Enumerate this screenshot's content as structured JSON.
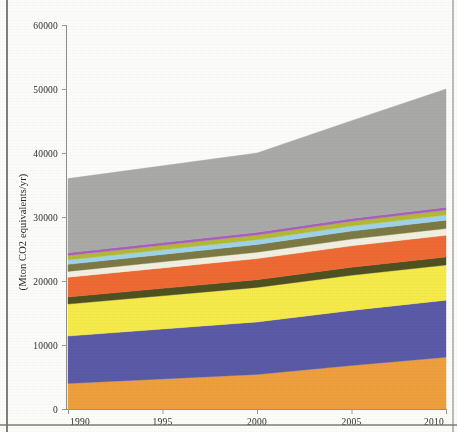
{
  "figure": {
    "kind": "stacked-area-chart",
    "background_color": "#fdfdfb"
  },
  "axes": {
    "y_title": "(Mton CO2 equivalents/yr)",
    "y_ticks": [
      "0",
      "10000",
      "20000",
      "30000",
      "40000",
      "50000",
      "60000"
    ],
    "x_ticks": [
      "1990",
      "1995",
      "2000",
      "2005",
      "2010"
    ]
  },
  "chart_data": {
    "type": "area",
    "title": "",
    "subtitle": "",
    "xlabel": "",
    "ylabel": "(Mton CO2 equivalents/yr)",
    "xlim": [
      1990,
      2010
    ],
    "ylim": [
      0,
      60000
    ],
    "x": [
      1990,
      1995,
      2000,
      2005,
      2010
    ],
    "y_ticks": [
      0,
      10000,
      20000,
      30000,
      40000,
      50000,
      60000
    ],
    "x_ticks": [
      1990,
      1995,
      2000,
      2005,
      2010
    ],
    "grid": false,
    "legend": "none",
    "stacked": true,
    "stack_order": "bottom-to-top",
    "units": "Mton CO2 equivalents/yr",
    "series": [
      {
        "name": "band-1-orange",
        "color": "#f0a03c",
        "values": [
          4000,
          4700,
          5400,
          6800,
          8100
        ]
      },
      {
        "name": "band-2-blue",
        "color": "#5a5aa8",
        "values": [
          7400,
          7800,
          8200,
          8600,
          8900
        ]
      },
      {
        "name": "band-3-yellow",
        "color": "#f7ec48",
        "values": [
          5000,
          5200,
          5400,
          5500,
          5500
        ]
      },
      {
        "name": "band-4-dark-olive",
        "color": "#4f521f",
        "values": [
          1100,
          1150,
          1200,
          1250,
          1250
        ]
      },
      {
        "name": "band-5-orange-red",
        "color": "#f06a33",
        "values": [
          3100,
          3200,
          3300,
          3350,
          3400
        ]
      },
      {
        "name": "band-6-cream",
        "color": "#f2f1e2",
        "values": [
          900,
          950,
          1000,
          1050,
          1050
        ]
      },
      {
        "name": "band-7-khaki",
        "color": "#7d7a44",
        "values": [
          1100,
          1150,
          1200,
          1250,
          1300
        ]
      },
      {
        "name": "band-8-light-blue",
        "color": "#9fd4ec",
        "values": [
          700,
          720,
          750,
          780,
          800
        ]
      },
      {
        "name": "band-9-olive-yellow",
        "color": "#b3bb33",
        "values": [
          700,
          720,
          740,
          760,
          780
        ]
      },
      {
        "name": "band-10-purple",
        "color": "#aa5fc0",
        "values": [
          400,
          410,
          420,
          430,
          440
        ]
      },
      {
        "name": "band-11-gray",
        "color": "#aaaaa8",
        "values": [
          11600,
          12000,
          12390,
          15280,
          18480
        ]
      }
    ],
    "totals": [
      38000,
      39980,
      41000,
      45000,
      50000
    ]
  }
}
